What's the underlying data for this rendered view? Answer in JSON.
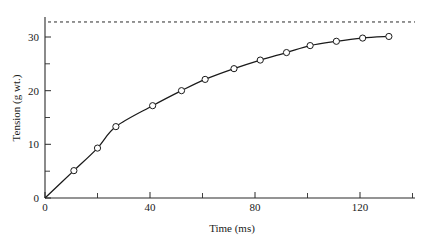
{
  "chart_data": {
    "type": "line",
    "title": "",
    "xlabel": "Time (ms)",
    "ylabel": "Tension (g wt.)",
    "xlim": [
      0,
      140
    ],
    "ylim": [
      0,
      34
    ],
    "grid": false,
    "legend": null,
    "x_ticks_major": [
      0,
      40,
      80,
      120
    ],
    "x_tick_labels": [
      "0",
      "40",
      "80",
      "120"
    ],
    "x_ticks_minor": [
      20,
      60,
      100,
      140
    ],
    "y_ticks_major": [
      0,
      10,
      20,
      30
    ],
    "y_tick_labels": [
      "0",
      "10",
      "20",
      "30"
    ],
    "y_ticks_minor": [
      5,
      15,
      25,
      35
    ],
    "series": [
      {
        "name": "Tension",
        "marker": "open-circle",
        "x": [
          0,
          11,
          20,
          27,
          41,
          52,
          61,
          72,
          82,
          92,
          101,
          111,
          121,
          131
        ],
        "values": [
          0,
          5.1,
          9.3,
          13.3,
          17.2,
          20.0,
          22.1,
          24.1,
          25.7,
          27.1,
          28.4,
          29.2,
          29.8,
          30.1
        ]
      }
    ],
    "annotations": [
      {
        "kind": "asymptote",
        "style": "dashed-horizontal",
        "value": 32.8,
        "label": ""
      }
    ]
  },
  "axes": {
    "x_label": "Time (ms)",
    "y_label": "Tension (g wt.)"
  }
}
